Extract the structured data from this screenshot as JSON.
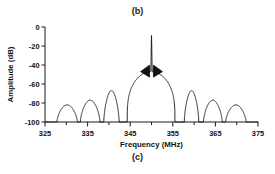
{
  "figure": {
    "caption_top": "(b)",
    "caption_bottom": "(c)",
    "line_color": "#111111",
    "axis_color": "#1a1a1a",
    "background_color": "#ffffff"
  },
  "chart_data": {
    "type": "line",
    "title": "",
    "xlabel": "Frequency (MHz)",
    "ylabel": "Amplitude (dB)",
    "xlim": [
      325,
      375
    ],
    "ylim": [
      -100,
      0
    ],
    "xticks": [
      325,
      335,
      345,
      355,
      365,
      375
    ],
    "xtick_labels": [
      "325",
      "335",
      "345",
      "355",
      "365",
      "375"
    ],
    "yticks": [
      0,
      -20,
      -40,
      -60,
      -80,
      -100
    ],
    "ytick_labels": [
      "0",
      "-20",
      "-40",
      "-60",
      "-80",
      "-100"
    ],
    "xminor_interval": 5,
    "grid": false,
    "legend": null,
    "series": [
      {
        "name": "filter-response",
        "description": "Bandpass filter magnitude response with narrow carrier spike at band center",
        "features": {
          "main_lobe_range": [
            344.3,
            355.5
          ],
          "main_lobe_plateau_db": -47,
          "center_spike_frequency": 350.0,
          "center_spike_peak_db": -9,
          "center_spike_half_width": 0.35,
          "shoulder_cluster_db": -40,
          "noise_floor_db": -100
        },
        "sidelobes": [
          {
            "center": 330.2,
            "peak_db": -82
          },
          {
            "center": 335.6,
            "peak_db": -77
          },
          {
            "center": 340.6,
            "peak_db": -67
          },
          {
            "center": 359.4,
            "peak_db": -67
          },
          {
            "center": 364.4,
            "peak_db": -77
          },
          {
            "center": 369.8,
            "peak_db": -82
          }
        ],
        "nulls": [
          327.8,
          332.6,
          333.3,
          338.0,
          338.8,
          343.6,
          344.3,
          355.5,
          356.3,
          361.1,
          361.9,
          366.6,
          367.4,
          372.2
        ]
      }
    ]
  }
}
